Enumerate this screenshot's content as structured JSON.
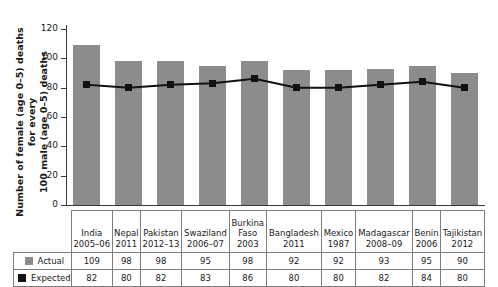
{
  "chart_data": {
    "type": "bar",
    "title": "",
    "xlabel": "",
    "ylabel": "Number of female (age 0–5) deaths for every\n100 male (age 0–5) deaths",
    "ylim": [
      0,
      120
    ],
    "yticks": [
      0,
      20,
      40,
      60,
      80,
      100,
      120
    ],
    "grid": false,
    "legend_position": "table-left",
    "categories": [
      "India\n2005–06",
      "Nepal\n2011",
      "Pakistan\n2012–13",
      "Swaziland\n2006–07",
      "Burkina\nFaso\n2003",
      "Bangladesh\n2011",
      "Mexico\n1987",
      "Madagascar\n2008–09",
      "Benin\n2006",
      "Tajikistan\n2012"
    ],
    "series": [
      {
        "name": "Actual",
        "type": "bar",
        "color": "#8c8c8c",
        "values": [
          109,
          98,
          98,
          95,
          98,
          92,
          92,
          93,
          95,
          90
        ]
      },
      {
        "name": "Expected",
        "type": "line",
        "color": "#111111",
        "values": [
          82,
          80,
          82,
          83,
          86,
          80,
          80,
          82,
          84,
          80
        ]
      }
    ]
  },
  "table": {
    "row_labels": [
      "Actual",
      "Expected"
    ]
  }
}
